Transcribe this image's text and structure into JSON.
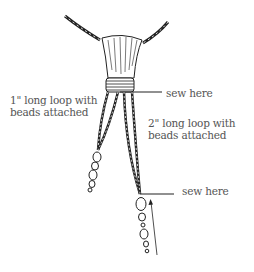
{
  "diagram": {
    "labels": {
      "loop_short_line1": "1\" long loop with",
      "loop_short_line2": "beads attached",
      "loop_long_line1": "2\" long loop with",
      "loop_long_line2": "beads attached",
      "sew_top": "sew here",
      "sew_bottom": "sew here"
    },
    "parts": [
      "twisted-cord",
      "tassel-head",
      "thread-wrap",
      "short-bead-loop",
      "long-bead-loop",
      "arrow"
    ],
    "colors": {
      "line": "#222222",
      "text": "#555555",
      "background": "#ffffff"
    }
  }
}
